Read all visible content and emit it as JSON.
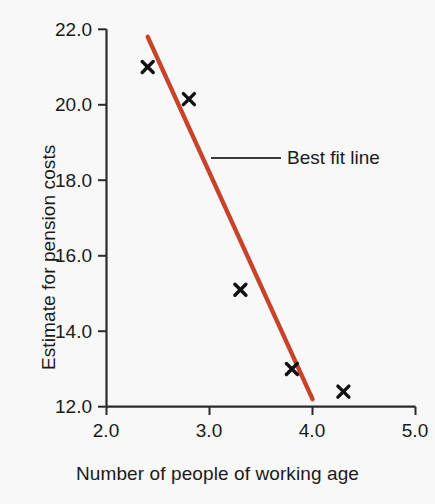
{
  "chart_data": {
    "type": "scatter",
    "title": "",
    "xlabel": "Number of people of working age",
    "ylabel": "Estimate for pension costs",
    "xlim": [
      2.0,
      5.0
    ],
    "ylim": [
      12.0,
      22.0
    ],
    "xticks": [
      "2.0",
      "3.0",
      "4.0",
      "5.0"
    ],
    "xtick_values": [
      2.0,
      3.0,
      4.0,
      5.0
    ],
    "yticks": [
      "12.0",
      "14.0",
      "16.0",
      "18.0",
      "20.0",
      "22.0"
    ],
    "ytick_values": [
      12.0,
      14.0,
      16.0,
      18.0,
      20.0,
      22.0
    ],
    "grid": false,
    "series": [
      {
        "name": "Data points",
        "marker": "x",
        "marker_color": "#111111",
        "points": [
          {
            "x": 2.4,
            "y": 21.0
          },
          {
            "x": 2.8,
            "y": 20.15
          },
          {
            "x": 3.3,
            "y": 15.1
          },
          {
            "x": 3.8,
            "y": 13.0
          },
          {
            "x": 4.3,
            "y": 12.4
          }
        ]
      },
      {
        "name": "Best fit line",
        "type": "line",
        "color": "#c7442a",
        "points": [
          {
            "x": 2.4,
            "y": 21.8
          },
          {
            "x": 4.0,
            "y": 12.2
          }
        ]
      }
    ],
    "legend": {
      "position": "inside-upper-right",
      "entries": [
        {
          "label": "Best fit line",
          "swatch": "line",
          "color": "#3a3a3a"
        }
      ]
    },
    "colors": {
      "background": "#f7f8f7",
      "axis": "#2b2b2b",
      "text": "#1a1a1a",
      "best_fit_line": "#c7442a",
      "marker": "#111111",
      "legend_line": "#3a3a3a"
    }
  },
  "legend": {
    "best_fit_label": "Best fit line"
  },
  "axes": {
    "x_title": "Number of people of working age",
    "y_title": "Estimate for pension costs",
    "x_tick_labels": [
      "2.0",
      "3.0",
      "4.0",
      "5.0"
    ],
    "y_tick_labels": [
      "22.0",
      "20.0",
      "18.0",
      "16.0",
      "14.0",
      "12.0"
    ]
  }
}
